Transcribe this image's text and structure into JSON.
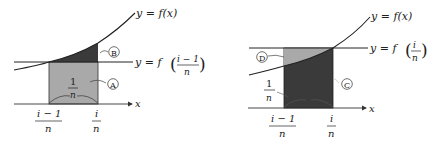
{
  "left_panel": {
    "curve_label": "y = f(x)",
    "line_label_prefix": "y = f",
    "line_label_num": "i − 1",
    "line_label_den": "n",
    "width_num": "1",
    "width_den": "n",
    "x_axis_label": "x",
    "tick_left_num": "i − 1",
    "tick_left_den": "n",
    "tick_right_num": "i",
    "tick_right_den": "n",
    "region_upper": "B",
    "region_lower": "A",
    "colors": {
      "region_lower": "#a9a9a9",
      "region_upper": "#3a3a3a"
    }
  },
  "right_panel": {
    "curve_label": "y = f(x)",
    "line_label_prefix": "y = f",
    "line_label_num": "i",
    "line_label_den": "n",
    "width_num": "1",
    "width_den": "n",
    "x_axis_label": "x",
    "tick_left_num": "i − 1",
    "tick_left_den": "n",
    "tick_right_num": "i",
    "tick_right_den": "n",
    "region_upper": "D",
    "region_lower": "C",
    "colors": {
      "region_upper": "#a9a9a9",
      "region_lower": "#3a3a3a"
    }
  }
}
